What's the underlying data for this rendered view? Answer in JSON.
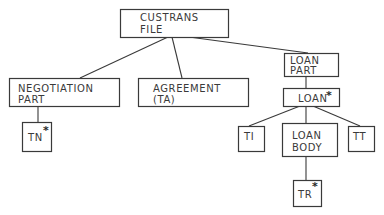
{
  "diagram": {
    "type": "hierarchy-tree",
    "colors": {
      "line": "#3a3a3a",
      "background": "#ffffff"
    },
    "nodes": {
      "custrans": {
        "line1": "CUSTRANS",
        "line2": "FILE",
        "marker": ""
      },
      "negotiation": {
        "line1": "NEGOTIATION",
        "line2": "PART",
        "marker": ""
      },
      "agreement": {
        "line1": "AGREEMENT",
        "line2": "(TA)",
        "marker": ""
      },
      "loan_part": {
        "line1": "LOAN",
        "line2": "PART",
        "marker": ""
      },
      "loan": {
        "line1": "LOAN",
        "marker": "*"
      },
      "tn": {
        "line1": "TN",
        "marker": "*"
      },
      "ti": {
        "line1": "TI",
        "marker": ""
      },
      "loan_body": {
        "line1": "LOAN",
        "line2": "BODY",
        "marker": ""
      },
      "tt": {
        "line1": "TT",
        "marker": ""
      },
      "tr": {
        "line1": "TR",
        "marker": "*"
      }
    },
    "edges": [
      [
        "custrans",
        "negotiation"
      ],
      [
        "custrans",
        "agreement"
      ],
      [
        "custrans",
        "loan_part"
      ],
      [
        "negotiation",
        "tn"
      ],
      [
        "loan_part",
        "loan"
      ],
      [
        "loan",
        "ti"
      ],
      [
        "loan",
        "loan_body"
      ],
      [
        "loan",
        "tt"
      ],
      [
        "loan_body",
        "tr"
      ]
    ]
  }
}
